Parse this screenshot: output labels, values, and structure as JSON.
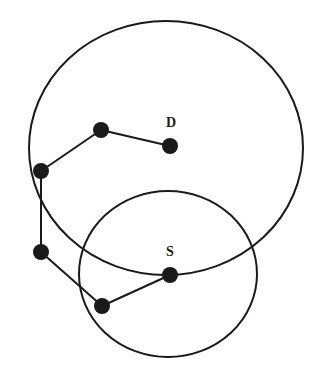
{
  "diagram": {
    "stroke_color": "#1a1a1a",
    "background": "#ffffff",
    "circles": [
      {
        "id": "large-range",
        "cx": 166,
        "cy": 148,
        "rx": 137,
        "ry": 127
      },
      {
        "id": "small-range",
        "cx": 168,
        "cy": 274,
        "rx": 89,
        "ry": 83
      }
    ],
    "nodes": [
      {
        "id": "D",
        "x": 170,
        "y": 146,
        "label": "D",
        "label_x": 166,
        "label_y": 127
      },
      {
        "id": "n1",
        "x": 101,
        "y": 130
      },
      {
        "id": "n2",
        "x": 41,
        "y": 171
      },
      {
        "id": "n3",
        "x": 41,
        "y": 252
      },
      {
        "id": "n4",
        "x": 102,
        "y": 306
      },
      {
        "id": "S",
        "x": 170,
        "y": 275,
        "label": "S",
        "label_x": 166,
        "label_y": 256
      }
    ],
    "path": [
      "D",
      "n1",
      "n2",
      "n3",
      "n4",
      "S"
    ],
    "labels": {
      "destination": "D",
      "source": "S"
    }
  }
}
